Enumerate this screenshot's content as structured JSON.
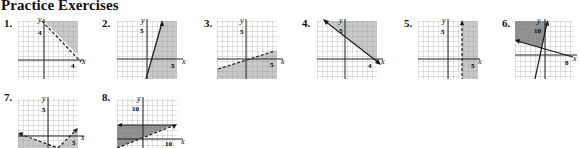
{
  "title": "Practice Exercises",
  "colors": {
    "grid": "#9a9a9a",
    "axis": "#222222",
    "shade": "#c9c9c9",
    "shade_dark": "#8f8f8f",
    "line": "#1a1a1a"
  },
  "exercises": [
    {
      "number": "1.",
      "x_label": "x",
      "y_label": "y",
      "ticks": [
        {
          "axis": "y",
          "value": "4"
        },
        {
          "axis": "x",
          "value": "4"
        }
      ],
      "boundary": [
        {
          "type": "dashed",
          "equation": "x + y = 4"
        }
      ],
      "shading": "above-right"
    },
    {
      "number": "2.",
      "x_label": "x",
      "y_label": "y",
      "ticks": [
        {
          "axis": "y",
          "value": "5"
        },
        {
          "axis": "x",
          "value": "5"
        }
      ],
      "boundary": [
        {
          "type": "solid",
          "equation": "steep line through (1,0)"
        }
      ],
      "shading": "right"
    },
    {
      "number": "3.",
      "x_label": "x",
      "y_label": "y",
      "ticks": [
        {
          "axis": "y",
          "value": "5"
        },
        {
          "axis": "x",
          "value": "5"
        }
      ],
      "boundary": [
        {
          "type": "dashed",
          "equation": "shallow positive slope"
        }
      ],
      "shading": "below"
    },
    {
      "number": "4.",
      "x_label": "x",
      "y_label": "y",
      "ticks": [
        {
          "axis": "y",
          "value": "5"
        },
        {
          "axis": "x",
          "value": "4"
        }
      ],
      "boundary": [
        {
          "type": "solid",
          "equation": "negative slope through (4,0)"
        }
      ],
      "shading": "above"
    },
    {
      "number": "5.",
      "x_label": "x",
      "y_label": "y",
      "ticks": [
        {
          "axis": "y",
          "value": "5"
        },
        {
          "axis": "x",
          "value": "5"
        }
      ],
      "boundary": [
        {
          "type": "dashed",
          "equation": "x = 4"
        }
      ],
      "shading": "right"
    },
    {
      "number": "6.",
      "x_label": "x",
      "y_label": "y",
      "ticks": [
        {
          "axis": "y",
          "value": "10"
        },
        {
          "axis": "x",
          "value": "8"
        }
      ],
      "boundary": [
        {
          "type": "solid",
          "equation": "steep line"
        },
        {
          "type": "solid",
          "equation": "negative slope line"
        }
      ],
      "shading": "upper-left region"
    },
    {
      "number": "7.",
      "x_label": "x",
      "y_label": "y",
      "ticks": [
        {
          "axis": "y",
          "value": "5"
        },
        {
          "axis": "x",
          "value": "5"
        }
      ],
      "boundary": [
        {
          "type": "dashed",
          "equation": "V-shaped"
        }
      ],
      "shading": "below"
    },
    {
      "number": "8.",
      "x_label": "x",
      "y_label": "y",
      "ticks": [
        {
          "axis": "y",
          "value": "10"
        },
        {
          "axis": "x",
          "value": "10"
        }
      ],
      "boundary": [
        {
          "type": "solid",
          "equation": "y = 5"
        },
        {
          "type": "dashed",
          "equation": "positive slope"
        }
      ],
      "shading": "between"
    }
  ]
}
